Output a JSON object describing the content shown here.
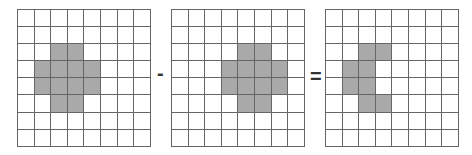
{
  "diagram": {
    "colors": {
      "filled": "#a9a9a9",
      "empty": "#ffffff",
      "line": "#666666"
    },
    "rows": 8,
    "cols": 8,
    "operators": {
      "minus": "-",
      "equals": "="
    },
    "grids": [
      {
        "name": "grid-a",
        "filled": [
          [
            2,
            2
          ],
          [
            2,
            3
          ],
          [
            3,
            1
          ],
          [
            3,
            2
          ],
          [
            3,
            3
          ],
          [
            3,
            4
          ],
          [
            4,
            1
          ],
          [
            4,
            2
          ],
          [
            4,
            3
          ],
          [
            4,
            4
          ],
          [
            5,
            2
          ],
          [
            5,
            3
          ]
        ]
      },
      {
        "name": "grid-b",
        "filled": [
          [
            2,
            4
          ],
          [
            2,
            5
          ],
          [
            3,
            3
          ],
          [
            3,
            4
          ],
          [
            3,
            5
          ],
          [
            3,
            6
          ],
          [
            4,
            3
          ],
          [
            4,
            4
          ],
          [
            4,
            5
          ],
          [
            4,
            6
          ],
          [
            5,
            4
          ],
          [
            5,
            5
          ]
        ]
      },
      {
        "name": "grid-result",
        "filled": [
          [
            2,
            2
          ],
          [
            2,
            3
          ],
          [
            3,
            1
          ],
          [
            3,
            2
          ],
          [
            4,
            1
          ],
          [
            4,
            2
          ],
          [
            5,
            2
          ],
          [
            5,
            3
          ]
        ]
      }
    ]
  }
}
